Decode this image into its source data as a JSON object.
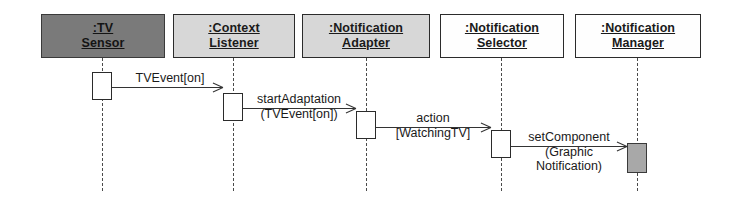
{
  "diagram": {
    "type": "uml-sequence-diagram",
    "title": "",
    "width": 735,
    "height": 210,
    "background_color": "#ffffff",
    "line_color": "#333333"
  },
  "lifelines": [
    {
      "id": "tv-sensor",
      "name_line1": ":TV",
      "name_line2": "Sensor",
      "fill_color": "#7a7a7a",
      "shade": "dark"
    },
    {
      "id": "context-listener",
      "name_line1": ":Context",
      "name_line2": "Listener",
      "fill_color": "#d7d7d7",
      "shade": "gray"
    },
    {
      "id": "notification-adapter",
      "name_line1": ":Notification",
      "name_line2": "Adapter",
      "fill_color": "#d7d7d7",
      "shade": "gray"
    },
    {
      "id": "notification-selector",
      "name_line1": ":Notification",
      "name_line2": "Selector",
      "fill_color": "#fefefe",
      "shade": "white"
    },
    {
      "id": "notification-manager",
      "name_line1": ":Notification",
      "name_line2": "Manager",
      "fill_color": "#fefefe",
      "shade": "white"
    }
  ],
  "messages": [
    {
      "id": "msg-tvevent",
      "from": "tv-sensor",
      "to": "context-listener",
      "label_line1": "TVEvent[on]",
      "label_line2": "",
      "label_line3": ""
    },
    {
      "id": "msg-startadaptation",
      "from": "context-listener",
      "to": "notification-adapter",
      "label_line1": "startAdaptation",
      "label_line2": "(TVEvent[on])",
      "label_line3": ""
    },
    {
      "id": "msg-action",
      "from": "notification-adapter",
      "to": "notification-selector",
      "label_line1": "action",
      "label_line2": "[WatchingTV]",
      "label_line3": ""
    },
    {
      "id": "msg-setcomponent",
      "from": "notification-selector",
      "to": "notification-manager",
      "label_line1": "setComponent",
      "label_line2": "(Graphic",
      "label_line3": "Notification)"
    }
  ],
  "activations": [
    {
      "id": "act-tv-sensor",
      "lifeline": "tv-sensor",
      "filled": false
    },
    {
      "id": "act-context-listener",
      "lifeline": "context-listener",
      "filled": false
    },
    {
      "id": "act-notification-adapter",
      "lifeline": "notification-adapter",
      "filled": false
    },
    {
      "id": "act-notification-selector",
      "lifeline": "notification-selector",
      "filled": false
    },
    {
      "id": "act-notification-manager",
      "lifeline": "notification-manager",
      "filled": true
    }
  ]
}
